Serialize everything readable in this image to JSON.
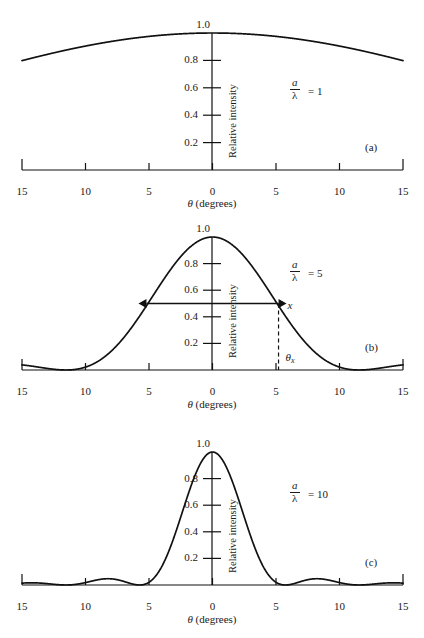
{
  "figure": {
    "axis": {
      "x_label_theta": "θ",
      "x_label_units": "(degrees)",
      "y_label": "Relative intensity",
      "x_ticks": [
        "15",
        "10",
        "5",
        "0",
        "5",
        "10",
        "15"
      ],
      "x_tick_values": [
        -15,
        -10,
        -5,
        0,
        5,
        10,
        15
      ],
      "y_ticks": [
        "0.2",
        "0.4",
        "0.6",
        "0.8",
        "1.0"
      ],
      "y_tick_values": [
        0.2,
        0.4,
        0.6,
        0.8,
        1.0
      ]
    },
    "ratio_symbol": {
      "numerator": "a",
      "denominator": "λ"
    },
    "panels": [
      {
        "id": "a",
        "panel_label": "(a)",
        "ratio_equals": "= 1",
        "ratio_value": 1
      },
      {
        "id": "b",
        "panel_label": "(b)",
        "ratio_equals": "= 5",
        "ratio_value": 5,
        "annotations": {
          "width_marker_label": "x",
          "angle_marker_label": "θ",
          "angle_marker_sub": "x",
          "width_level": 0.5
        }
      },
      {
        "id": "c",
        "panel_label": "(c)",
        "ratio_equals": "= 10",
        "ratio_value": 10
      }
    ]
  },
  "chart_data": [
    {
      "type": "line",
      "id": "panel-a",
      "title": "",
      "xlabel": "θ (degrees)",
      "ylabel": "Relative intensity",
      "xlim": [
        -15,
        15
      ],
      "ylim": [
        0,
        1.0
      ],
      "grid": false,
      "legend": null,
      "annotation": "a/λ = 1",
      "function": "sinc^2(pi * (a/lambda) * sin(theta))",
      "a_over_lambda": 1,
      "x": [
        -15,
        -12.5,
        -10,
        -7.5,
        -5,
        -2.5,
        0,
        2.5,
        5,
        7.5,
        10,
        12.5,
        15
      ],
      "y": [
        0.78,
        0.845,
        0.9,
        0.945,
        0.975,
        0.994,
        1.0,
        0.994,
        0.975,
        0.945,
        0.9,
        0.845,
        0.78
      ]
    },
    {
      "type": "line",
      "id": "panel-b",
      "title": "",
      "xlabel": "θ (degrees)",
      "ylabel": "Relative intensity",
      "xlim": [
        -15,
        15
      ],
      "ylim": [
        0,
        1.0
      ],
      "grid": false,
      "legend": null,
      "annotation": "a/λ = 5",
      "function": "sinc^2(pi * (a/lambda) * sin(theta))",
      "a_over_lambda": 5,
      "zeros_degrees": [
        -11.5,
        11.5
      ],
      "fwhm_degrees": [
        -5.2,
        5.2
      ],
      "x": [
        -15,
        -13,
        -11.5,
        -10,
        -8,
        -6,
        -4,
        -2,
        0,
        2,
        4,
        6,
        8,
        10,
        11.5,
        13,
        15
      ],
      "y": [
        0.048,
        0.012,
        0.0,
        0.022,
        0.155,
        0.4,
        0.68,
        0.915,
        1.0,
        0.915,
        0.68,
        0.4,
        0.155,
        0.022,
        0.0,
        0.012,
        0.048
      ]
    },
    {
      "type": "line",
      "id": "panel-c",
      "title": "",
      "xlabel": "θ (degrees)",
      "ylabel": "Relative intensity",
      "xlim": [
        -15,
        15
      ],
      "ylim": [
        0,
        1.0
      ],
      "grid": false,
      "legend": null,
      "annotation": "a/λ = 10",
      "function": "sinc^2(pi * (a/lambda) * sin(theta))",
      "a_over_lambda": 10,
      "zeros_degrees": [
        -15,
        -10,
        -5,
        5,
        10,
        15
      ],
      "side_lobe_peaks_degrees": [
        -12.5,
        -7.5,
        7.5,
        12.5
      ],
      "side_lobe_peak_values": [
        0.017,
        0.047,
        0.047,
        0.017
      ],
      "x": [
        -15,
        -12.5,
        -10,
        -7.5,
        -5,
        -4,
        -3,
        -2,
        -1,
        0,
        1,
        2,
        3,
        4,
        5,
        7.5,
        10,
        12.5,
        15
      ],
      "y": [
        0.0,
        0.017,
        0.0,
        0.047,
        0.0,
        0.12,
        0.45,
        0.83,
        0.985,
        1.0,
        0.985,
        0.83,
        0.45,
        0.12,
        0.0,
        0.047,
        0.0,
        0.017,
        0.0
      ]
    }
  ]
}
